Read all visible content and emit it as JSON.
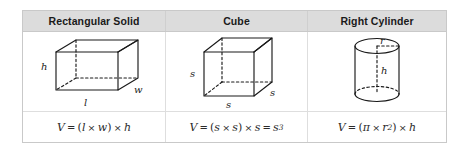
{
  "table": {
    "columns": [
      {
        "id": "rectangular-solid",
        "header": "Rectangular Solid",
        "figure": {
          "shape": "rectangular-prism",
          "labels": [
            "h",
            "l",
            "w"
          ]
        },
        "formula": {
          "text": "V = (l × w) × h",
          "parts": {
            "lhs": "V",
            "equals": "=",
            "open": "(",
            "a": "l",
            "times1": "×",
            "b": "w",
            "close": ")",
            "times2": "×",
            "c": "h"
          }
        }
      },
      {
        "id": "cube",
        "header": "Cube",
        "figure": {
          "shape": "cube",
          "labels": [
            "s",
            "s",
            "s"
          ]
        },
        "formula": {
          "text": "V = (s × s) × s = s³",
          "parts": {
            "lhs": "V",
            "equals": "=",
            "open": "(",
            "a": "s",
            "times1": "×",
            "b": "s",
            "close": ")",
            "times2": "×",
            "c": "s",
            "equals2": "=",
            "result_base": "s",
            "result_exp": "3"
          }
        }
      },
      {
        "id": "right-cylinder",
        "header": "Right Cylinder",
        "figure": {
          "shape": "cylinder",
          "labels": [
            "r",
            "h"
          ]
        },
        "formula": {
          "text": "V = (π × r²) × h",
          "parts": {
            "lhs": "V",
            "equals": "=",
            "open": "(",
            "a": "π",
            "times1": "×",
            "b": "r",
            "b_exp": "2",
            "close": ")",
            "times2": "×",
            "c": "h"
          }
        }
      }
    ]
  },
  "colors": {
    "header_background": "#dcdcdc",
    "border": "#c9c9c9",
    "divider": "#dedede",
    "text": "#1a1a1a",
    "formula_text": "#2b2b2b",
    "page_background": "#ffffff"
  }
}
